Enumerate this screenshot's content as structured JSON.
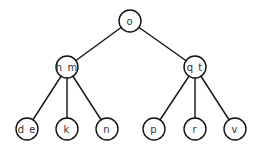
{
  "diagram": {
    "type": "b-tree",
    "nodes": [
      {
        "id": "root",
        "label": "o",
        "x": 130,
        "y": 21
      },
      {
        "id": "left",
        "label": "h m",
        "x": 67,
        "y": 67
      },
      {
        "id": "right",
        "label": "q t",
        "x": 195,
        "y": 67
      },
      {
        "id": "leaf1",
        "label": "d e",
        "x": 27,
        "y": 129
      },
      {
        "id": "leaf2",
        "label": "k",
        "x": 67,
        "y": 129
      },
      {
        "id": "leaf3",
        "label": "n",
        "x": 107,
        "y": 129
      },
      {
        "id": "leaf4",
        "label": "p",
        "x": 154,
        "y": 129
      },
      {
        "id": "leaf5",
        "label": "r",
        "x": 195,
        "y": 129
      },
      {
        "id": "leaf6",
        "label": "v",
        "x": 235,
        "y": 129
      }
    ],
    "edges": [
      [
        "root",
        "left"
      ],
      [
        "root",
        "right"
      ],
      [
        "left",
        "leaf1"
      ],
      [
        "left",
        "leaf2"
      ],
      [
        "left",
        "leaf3"
      ],
      [
        "right",
        "leaf4"
      ],
      [
        "right",
        "leaf5"
      ],
      [
        "right",
        "leaf6"
      ]
    ]
  }
}
